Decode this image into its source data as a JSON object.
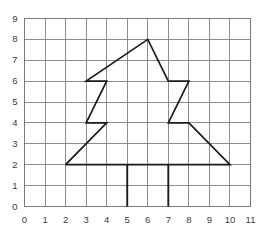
{
  "figure": {
    "title": "",
    "background_color": "#ffffff",
    "grid_color": "#8c8c8c",
    "shape_color": "#1a1a1a",
    "label_color": "#3b3b3b"
  },
  "chart_data": {
    "type": "line",
    "title": "",
    "xlabel": "",
    "ylabel": "",
    "xlim": [
      0,
      11
    ],
    "ylim": [
      0,
      9
    ],
    "grid": true,
    "legend": "none",
    "xticks": [
      0,
      1,
      2,
      3,
      4,
      5,
      6,
      7,
      8,
      9,
      10,
      11
    ],
    "xtick_labels": [
      "0",
      "1",
      "2",
      "3",
      "4",
      "5",
      "6",
      "7",
      "8",
      "9",
      "10",
      "11"
    ],
    "yticks": [
      0,
      1,
      2,
      3,
      4,
      5,
      6,
      7,
      8,
      9
    ],
    "ytick_labels": [
      "0",
      "1",
      "2",
      "3",
      "4",
      "5",
      "6",
      "7",
      "8",
      "9"
    ],
    "series": [
      {
        "name": "tree-outline",
        "closed": false,
        "points": [
          [
            2,
            2
          ],
          [
            4,
            4
          ],
          [
            3,
            4
          ],
          [
            4,
            6
          ],
          [
            3,
            6
          ],
          [
            6,
            8
          ],
          [
            7,
            6
          ],
          [
            8,
            6
          ],
          [
            7,
            4
          ],
          [
            8,
            4
          ],
          [
            10,
            2
          ],
          [
            2,
            2
          ]
        ]
      },
      {
        "name": "trunk-left-edge",
        "closed": false,
        "points": [
          [
            5,
            2
          ],
          [
            5,
            0
          ]
        ]
      },
      {
        "name": "trunk-right-edge",
        "closed": false,
        "points": [
          [
            7,
            2
          ],
          [
            7,
            0
          ]
        ]
      }
    ]
  }
}
